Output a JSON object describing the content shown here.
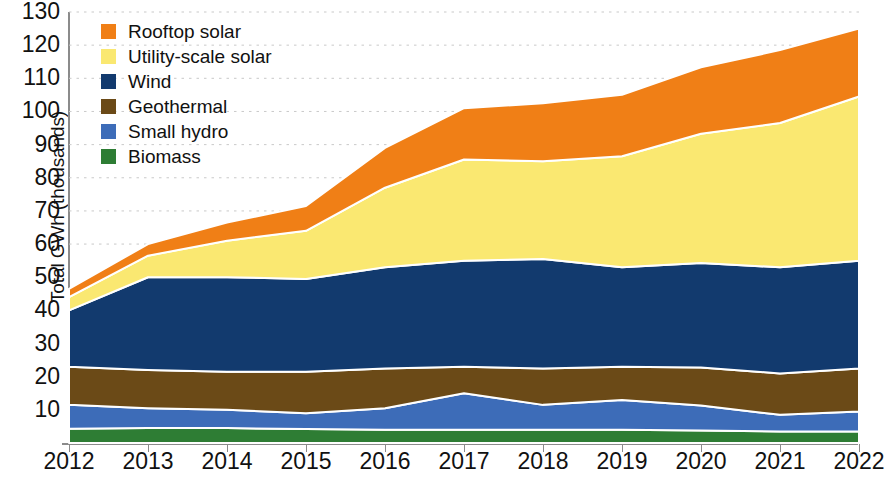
{
  "chart_data": {
    "type": "area",
    "stacked": true,
    "title": "",
    "xlabel": "",
    "ylabel": "Total GWh (thousands)",
    "categories": [
      "2012",
      "2013",
      "2014",
      "2015",
      "2016",
      "2017",
      "2018",
      "2019",
      "2020",
      "2021",
      "2022"
    ],
    "x": [
      2012,
      2013,
      2014,
      2015,
      2016,
      2017,
      2018,
      2019,
      2020,
      2021,
      2022
    ],
    "ylim": [
      0,
      130
    ],
    "yticks": [
      10,
      20,
      30,
      40,
      50,
      60,
      70,
      80,
      90,
      100,
      110,
      120,
      130
    ],
    "ytick_labels": [
      "10",
      "20",
      "30",
      "40",
      "50",
      "60",
      "70",
      "80",
      "90",
      "100",
      "110",
      "120",
      "130"
    ],
    "grid": "horizontal-dotted",
    "legend_position": "top-left",
    "stack_order_bottom_to_top": [
      "Biomass",
      "Small hydro",
      "Geothermal",
      "Wind",
      "Utility-scale solar",
      "Rooftop solar"
    ],
    "series": [
      {
        "name": "Rooftop solar",
        "color": "#F07F16",
        "values": [
          2.5,
          3.5,
          5.5,
          7.5,
          12.0,
          15.5,
          17.5,
          18.5,
          20.0,
          22.0,
          20.5
        ]
      },
      {
        "name": "Utility-scale solar",
        "color": "#FAE871",
        "values": [
          4.0,
          6.5,
          11.0,
          14.5,
          24.0,
          30.5,
          29.5,
          33.5,
          39.0,
          43.5,
          49.5
        ]
      },
      {
        "name": "Wind",
        "color": "#123A6E",
        "values": [
          17.0,
          28.0,
          28.5,
          28.0,
          30.5,
          32.0,
          33.0,
          30.0,
          31.5,
          32.0,
          32.5
        ]
      },
      {
        "name": "Geothermal",
        "color": "#6B4A17",
        "values": [
          11.5,
          11.5,
          11.5,
          12.5,
          12.0,
          8.0,
          11.0,
          10.0,
          11.5,
          12.5,
          13.0
        ]
      },
      {
        "name": "Small hydro",
        "color": "#3D6CB8",
        "values": [
          7.2,
          6.0,
          5.5,
          4.8,
          6.5,
          11.0,
          7.5,
          9.0,
          7.5,
          5.0,
          6.0
        ]
      },
      {
        "name": "Biomass",
        "color": "#2E7D34",
        "values": [
          4.3,
          4.5,
          4.5,
          4.2,
          4.0,
          4.0,
          4.0,
          4.0,
          3.8,
          3.5,
          3.5
        ]
      }
    ],
    "stacked_totals": [
      46.5,
      60.0,
      66.5,
      71.5,
      89.0,
      101.0,
      102.5,
      105.0,
      113.3,
      118.5,
      125.0
    ]
  },
  "legend": {
    "items": [
      {
        "label": "Rooftop solar",
        "color": "#F07F16"
      },
      {
        "label": "Utility-scale solar",
        "color": "#FAE871"
      },
      {
        "label": "Wind",
        "color": "#123A6E"
      },
      {
        "label": "Geothermal",
        "color": "#6B4A17"
      },
      {
        "label": "Small hydro",
        "color": "#3D6CB8"
      },
      {
        "label": "Biomass",
        "color": "#2E7D34"
      }
    ]
  },
  "axes": {
    "y_title": "Total GWh (thousands)"
  }
}
